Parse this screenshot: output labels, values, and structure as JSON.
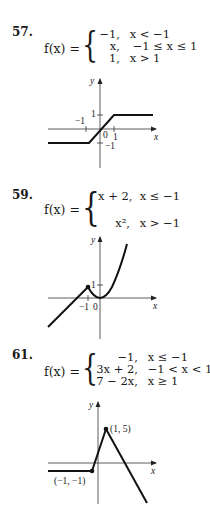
{
  "problems": [
    {
      "number": "57.",
      "lhs": "f(x) =",
      "pieces": [
        {
          "expr": "−1,",
          "cond": "x < −1"
        },
        {
          "expr": "x,",
          "cond": "−1 ≤ x ≤ 1"
        },
        {
          "expr": "1,",
          "cond": "x > 1"
        }
      ],
      "graph": {
        "axis_x": "x",
        "axis_y": "y",
        "labels": {
          "y_pos1": "1",
          "x_neg1": "−1",
          "origin": "0",
          "x_pos1": "1",
          "y_neg1": "−1"
        }
      }
    },
    {
      "number": "59.",
      "lhs": "f(x) =",
      "pieces": [
        {
          "expr": "x + 2,",
          "cond": "x ≤ −1"
        },
        {
          "expr": "x²,",
          "cond": "x > −1"
        }
      ],
      "graph": {
        "axis_x": "x",
        "axis_y": "y",
        "labels": {
          "y_pos1": "1",
          "x_neg1": "−1",
          "origin": "0"
        }
      }
    },
    {
      "number": "61.",
      "lhs": "f(x) =",
      "pieces": [
        {
          "expr": "−1,",
          "cond": "x ≤ −1"
        },
        {
          "expr": "3x + 2,",
          "cond": "−1 < x < 1"
        },
        {
          "expr": "7 − 2x,",
          "cond": "x ≥ 1"
        }
      ],
      "graph": {
        "axis_x": "x",
        "axis_y": "y",
        "labels": {
          "point_a": "(1, 5)",
          "point_b": "(−1, −1)"
        }
      }
    }
  ]
}
